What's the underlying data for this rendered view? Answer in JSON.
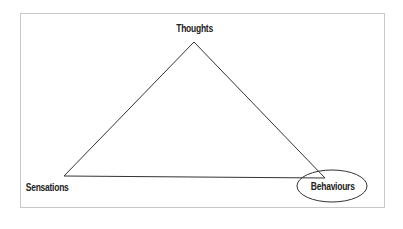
{
  "diagram": {
    "title": "",
    "nodes": [
      {
        "id": "thoughts",
        "label": "Thoughts",
        "position": "top"
      },
      {
        "id": "sensations",
        "label": "Sensations",
        "position": "bottom-left"
      },
      {
        "id": "behaviours",
        "label": "Behaviours",
        "position": "bottom-right",
        "highlighted": true
      }
    ],
    "edges": [
      {
        "from": "thoughts",
        "to": "sensations"
      },
      {
        "from": "sensations",
        "to": "behaviours"
      },
      {
        "from": "behaviours",
        "to": "thoughts"
      }
    ],
    "colors": {
      "line": "#333333",
      "border": "#c8c8c8",
      "background": "#ffffff"
    }
  }
}
